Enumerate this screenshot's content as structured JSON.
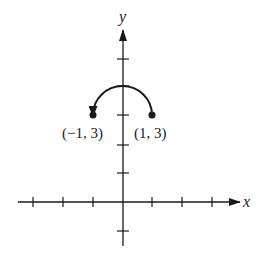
{
  "diagram": {
    "axes": {
      "x_label": "x",
      "y_label": "y"
    },
    "points": [
      {
        "label": "(−1, 3)",
        "x": -1,
        "y": 3
      },
      {
        "label": "(1, 3)",
        "x": 1,
        "y": 3
      }
    ],
    "arc": {
      "from": "(1, 3)",
      "to": "(−1, 3)",
      "direction": "counterclockwise",
      "shape": "upper semicircle with arrowhead"
    },
    "x_ticks": [
      -3,
      -2,
      -1,
      1,
      2,
      3
    ],
    "y_ticks": [
      -1,
      1,
      2,
      3,
      4,
      5
    ],
    "colors": {
      "ink": "#1a1a1a",
      "background": "#ffffff"
    }
  }
}
